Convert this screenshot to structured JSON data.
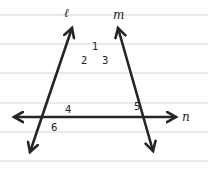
{
  "diagram": {
    "type": "transversal-lines",
    "background_color": "#ffffff",
    "ink_color": "#262626",
    "ruled_line_color": "#d6d6d6",
    "ruled_lines_y": [
      15,
      44,
      73,
      103,
      132,
      161
    ],
    "lines": [
      {
        "name": "l",
        "label": "ℓ",
        "from": [
          30,
          152
        ],
        "to": [
          72,
          28
        ]
      },
      {
        "name": "m",
        "label": "m",
        "from": [
          153,
          151
        ],
        "to": [
          118,
          28
        ]
      },
      {
        "name": "n",
        "label": "n",
        "from": [
          14,
          117
        ],
        "to": [
          176,
          117
        ]
      }
    ],
    "angle_labels": [
      {
        "id": "1",
        "text": "1",
        "x": 92,
        "y": 50
      },
      {
        "id": "2",
        "text": "2",
        "x": 81,
        "y": 64
      },
      {
        "id": "3",
        "text": "3",
        "x": 102,
        "y": 64
      },
      {
        "id": "4",
        "text": "4",
        "x": 65,
        "y": 113
      },
      {
        "id": "5",
        "text": "5",
        "x": 134,
        "y": 110
      },
      {
        "id": "6",
        "text": "6",
        "x": 51,
        "y": 131
      }
    ],
    "line_labels": {
      "l": {
        "text": "ℓ",
        "x": 64,
        "y": 17
      },
      "m": {
        "text": "m",
        "x": 113,
        "y": 19
      },
      "n": {
        "text": "n",
        "x": 182,
        "y": 121
      }
    }
  }
}
